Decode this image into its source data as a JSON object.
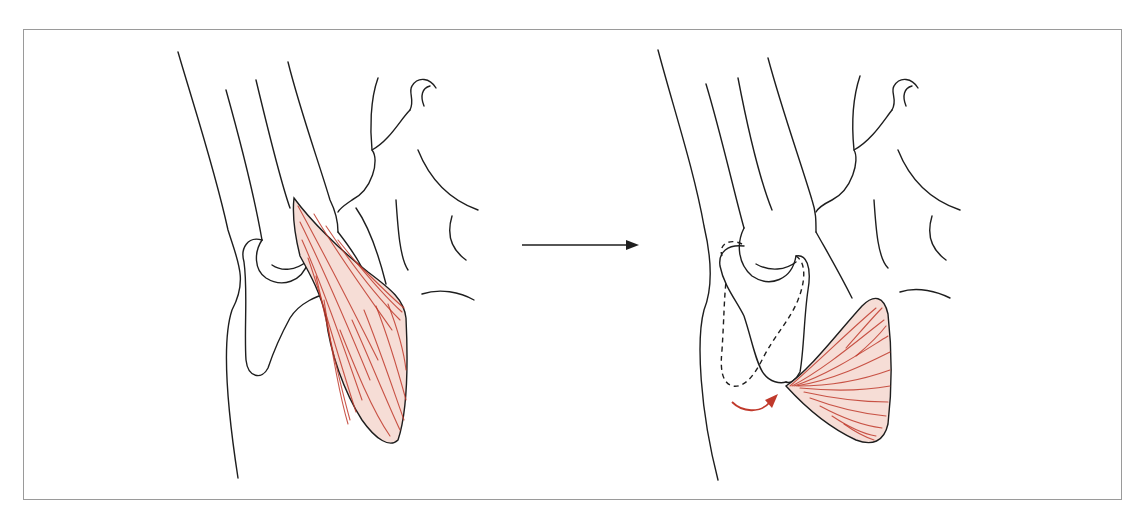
{
  "figure": {
    "panels": [
      {
        "id": "before",
        "label": "before",
        "muscle_state": "elongated muscle origin on humerus"
      },
      {
        "id": "after",
        "label": "after",
        "muscle_state": "muscle flipped with rotation arrow; dashed outline shows original olecranon position"
      }
    ],
    "transition_arrow": "right-arrow",
    "colors": {
      "outline": "#1e1e1e",
      "muscle_fill": "#f6ddd6",
      "muscle_fiber": "#c0392b",
      "rotation_arrow": "#c0392b",
      "frame": "#9a9a9a"
    }
  }
}
